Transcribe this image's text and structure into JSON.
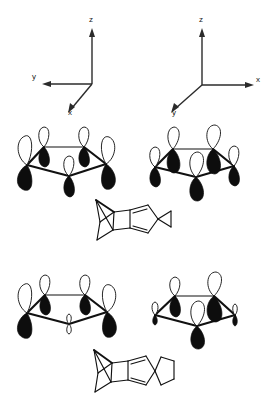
{
  "figure": {
    "background_color": "#ffffff",
    "ink_color": "#111111",
    "lobe_filled_color": "#0d0d0d",
    "lobe_open_color": "#ffffff",
    "width": 261,
    "height": 414
  },
  "axis_systems": [
    {
      "id": "axes-left",
      "position": "top-left",
      "axes": [
        {
          "label": "z",
          "direction": "up",
          "label_x": 61,
          "label_y": 10
        },
        {
          "label": "y",
          "direction": "left",
          "label_x": 4,
          "label_y": 67
        },
        {
          "label": "x",
          "direction": "down-left",
          "label_x": 40,
          "label_y": 103
        }
      ]
    },
    {
      "id": "axes-right",
      "position": "top-right",
      "axes": [
        {
          "label": "z",
          "direction": "up",
          "label_x": 41,
          "label_y": 10
        },
        {
          "label": "x",
          "direction": "right",
          "label_x": 98,
          "label_y": 70
        },
        {
          "label": "y",
          "direction": "down-left",
          "label_x": 14,
          "label_y": 103
        }
      ]
    }
  ],
  "orbital_diagrams": [
    {
      "id": "orbital-top-left",
      "position": "top-left",
      "ring_type": "cyclopentadienyl",
      "vertex_count": 5,
      "view": "front-edge-toward-viewer",
      "description": "five p-orbitals on a puckered five-membered ring, all in phase",
      "lobes": [
        {
          "vertex": 1,
          "size": "large",
          "top_phase": "open",
          "bottom_phase": "filled"
        },
        {
          "vertex": 2,
          "size": "medium",
          "top_phase": "open",
          "bottom_phase": "filled"
        },
        {
          "vertex": 3,
          "size": "medium",
          "top_phase": "open",
          "bottom_phase": "filled"
        },
        {
          "vertex": 4,
          "size": "large",
          "top_phase": "open",
          "bottom_phase": "filled"
        },
        {
          "vertex": 5,
          "size": "medium",
          "top_phase": "open",
          "bottom_phase": "filled"
        }
      ]
    },
    {
      "id": "orbital-top-right",
      "position": "top-right",
      "ring_type": "cyclopentadienyl",
      "vertex_count": 5,
      "view": "front-vertex-toward-viewer",
      "description": "five p-orbitals on a five-membered ring seen from the rotated axis frame, all in phase",
      "lobes": [
        {
          "vertex": 1,
          "size": "medium",
          "top_phase": "open",
          "bottom_phase": "filled"
        },
        {
          "vertex": 2,
          "size": "large",
          "top_phase": "open",
          "bottom_phase": "filled"
        },
        {
          "vertex": 3,
          "size": "large",
          "top_phase": "open",
          "bottom_phase": "filled"
        },
        {
          "vertex": 4,
          "size": "medium",
          "top_phase": "open",
          "bottom_phase": "filled"
        },
        {
          "vertex": 5,
          "size": "large",
          "top_phase": "open",
          "bottom_phase": "filled"
        }
      ]
    },
    {
      "id": "orbital-bottom-left",
      "position": "bottom-left",
      "ring_type": "cyclopentadienyl",
      "vertex_count": 5,
      "view": "front-edge-toward-viewer",
      "description": "five p-orbitals with a node at the front vertex, which carries only a vestigial orbital",
      "lobes": [
        {
          "vertex": 1,
          "size": "large",
          "top_phase": "open",
          "bottom_phase": "filled"
        },
        {
          "vertex": 2,
          "size": "medium",
          "top_phase": "open",
          "bottom_phase": "filled"
        },
        {
          "vertex": 3,
          "size": "medium",
          "top_phase": "open",
          "bottom_phase": "filled"
        },
        {
          "vertex": 4,
          "size": "large",
          "top_phase": "open",
          "bottom_phase": "filled"
        },
        {
          "vertex": 5,
          "size": "node",
          "top_phase": "open",
          "bottom_phase": "open"
        }
      ]
    },
    {
      "id": "orbital-bottom-right",
      "position": "bottom-right",
      "ring_type": "cyclopentadienyl",
      "vertex_count": 5,
      "view": "front-vertex-toward-viewer",
      "description": "five p-orbitals with large lobes on the central atoms and vestigial lobes on the two flanking atoms",
      "lobes": [
        {
          "vertex": 1,
          "size": "node",
          "top_phase": "open",
          "bottom_phase": "filled"
        },
        {
          "vertex": 2,
          "size": "medium",
          "top_phase": "open",
          "bottom_phase": "filled"
        },
        {
          "vertex": 3,
          "size": "large",
          "top_phase": "open",
          "bottom_phase": "filled"
        },
        {
          "vertex": 4,
          "size": "node",
          "top_phase": "open",
          "bottom_phase": "filled"
        },
        {
          "vertex": 5,
          "size": "large",
          "top_phase": "open",
          "bottom_phase": "filled"
        }
      ]
    }
  ],
  "molecule_structures": [
    {
      "id": "molecule-top",
      "position": "center-upper",
      "description": "polycyclic hydrocarbon skeleton with a bicyclic cage fused to a cyclopentadiene ring and a terminal three-membered ring"
    },
    {
      "id": "molecule-bottom",
      "position": "center-lower",
      "description": "polycyclic hydrocarbon skeleton with a bicyclic cage fused to a cyclopentadiene ring bearing a spiro-cyclopentane"
    }
  ]
}
